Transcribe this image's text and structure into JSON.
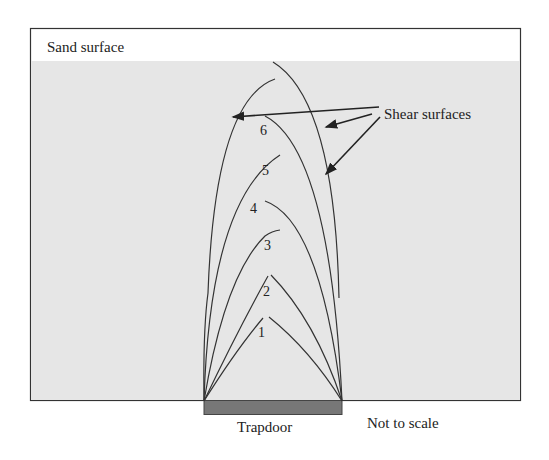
{
  "diagram": {
    "labels": {
      "sand_surface": "Sand surface",
      "shear_surfaces": "Shear surfaces",
      "trapdoor": "Trapdoor",
      "not_to_scale": "Not to scale"
    },
    "curve_numbers": [
      "1",
      "2",
      "3",
      "4",
      "5",
      "6"
    ],
    "colors": {
      "sand": "#e6e6e6",
      "frame": "#333333",
      "trapdoor": "#777777",
      "line": "#333333",
      "background": "#ffffff"
    }
  }
}
